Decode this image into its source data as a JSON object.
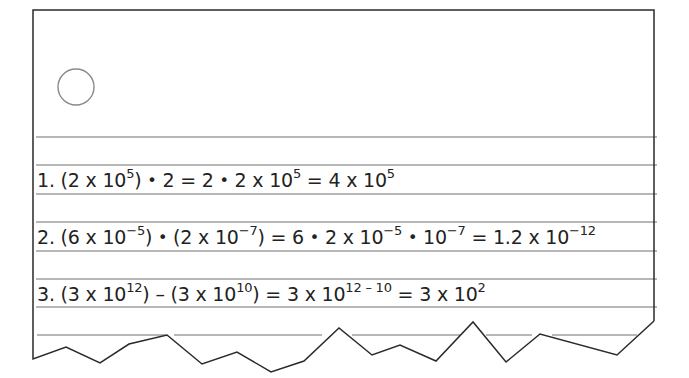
{
  "notebook": {
    "hole_count": 1,
    "line_color": "#6e6e6e",
    "border_color": "#333333"
  },
  "problems": [
    {
      "number": "1.",
      "parts": [
        {
          "t": "(2 x 10"
        },
        {
          "sup": "5"
        },
        {
          "t": ") "
        },
        {
          "dot": "•"
        },
        {
          "t": " 2 = 2 "
        },
        {
          "dot": "•"
        },
        {
          "t": " 2 x 10"
        },
        {
          "sup": "5"
        },
        {
          "t": " = 4 x 10"
        },
        {
          "sup": "5"
        }
      ],
      "text": "(2 x 10^5) • 2 = 2 • 2 x 10^5 = 4 x 10^5"
    },
    {
      "number": "2.",
      "parts": [
        {
          "t": "(6 x 10"
        },
        {
          "sup": "−5"
        },
        {
          "t": ") "
        },
        {
          "dot": "•"
        },
        {
          "t": " (2 x 10"
        },
        {
          "sup": "−7"
        },
        {
          "t": ") = 6 "
        },
        {
          "dot": "•"
        },
        {
          "t": " 2 x 10"
        },
        {
          "sup": "−5"
        },
        {
          "t": " "
        },
        {
          "dot": "•"
        },
        {
          "t": " 10"
        },
        {
          "sup": "−7"
        },
        {
          "t": " = 1.2 x 10"
        },
        {
          "sup": "−12"
        }
      ],
      "text": "(6 x 10^-5) • (2 x 10^-7) = 6 • 2 x 10^-5 • 10^-7 = 1.2 x 10^-12"
    },
    {
      "number": "3.",
      "parts": [
        {
          "t": "(3 x 10"
        },
        {
          "sup": "12"
        },
        {
          "t": ") – (3 x 10"
        },
        {
          "sup": "10"
        },
        {
          "t": ") = 3 x 10"
        },
        {
          "sup": "12 – 10"
        },
        {
          "t": " = 3 x 10"
        },
        {
          "sup": "2"
        }
      ],
      "text": "(3 x 10^12) – (3 x 10^10) = 3 x 10^(12 - 10) = 3 x 10^2"
    }
  ]
}
